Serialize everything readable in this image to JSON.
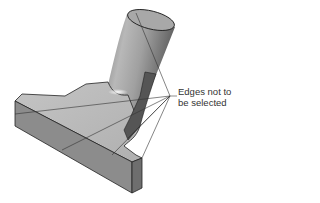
{
  "figure": {
    "colors": {
      "background": "#ffffff",
      "top_face": "#bdbdbd",
      "front_face": "#8a8a8a",
      "side_face": "#6e6e6e",
      "cylinder_light": "#c8c8c8",
      "cylinder_dark": "#5a5a5a",
      "edge": "#222222",
      "leader_line": "#444444",
      "label_text": "#333333"
    },
    "callout": {
      "line1": "Edges not to",
      "line2": "be selected",
      "leader_count": 6
    }
  }
}
